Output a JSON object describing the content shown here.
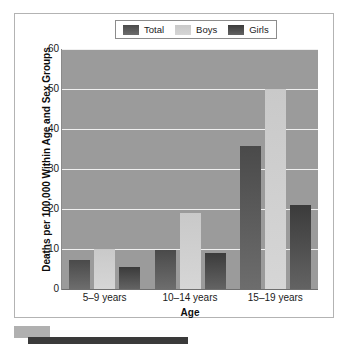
{
  "chart_data": {
    "type": "bar",
    "title": "",
    "xlabel": "Age",
    "ylabel": "Deaths per 100,000 Within Age and Sex Groups",
    "categories": [
      "5–9 years",
      "10–14 years",
      "15–19 years"
    ],
    "series": [
      {
        "name": "Total",
        "values": [
          7.2,
          9.7,
          35.7
        ],
        "color": "#555555"
      },
      {
        "name": "Boys",
        "values": [
          10.0,
          19.0,
          50.0
        ],
        "color": "#cfcfcf"
      },
      {
        "name": "Girls",
        "values": [
          5.6,
          9.0,
          21.0
        ],
        "color": "#4a4a4a"
      }
    ],
    "ylim": [
      0,
      60
    ],
    "yticks": [
      0,
      10,
      20,
      30,
      40,
      50,
      60
    ],
    "grid": true,
    "legend_position": "top-center",
    "plot_background": "#9b9b9b",
    "gridline_color": "#efefef"
  },
  "legend": {
    "items": [
      {
        "label": "Total",
        "swatch_name": "legend-swatch-total"
      },
      {
        "label": "Boys",
        "swatch_name": "legend-swatch-boys"
      },
      {
        "label": "Girls",
        "swatch_name": "legend-swatch-girls"
      }
    ]
  },
  "axes": {
    "y_title": "Deaths per 100,000 Within Age and Sex Groups",
    "x_title": "Age",
    "y_ticks": [
      "60",
      "50",
      "40",
      "30",
      "20",
      "10",
      "0"
    ],
    "x_ticks": [
      "5–9 years",
      "10–14 years",
      "15–19 years"
    ]
  }
}
